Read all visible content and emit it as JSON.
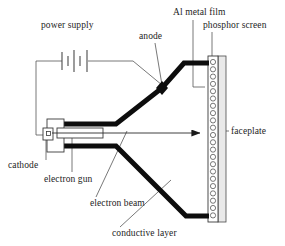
{
  "figure": {
    "background_color": "#ffffff",
    "ink_color": "#1a1a1a",
    "width": 285,
    "height": 246
  },
  "labels": {
    "power_supply": "power supply",
    "anode": "anode",
    "al_metal_film": "Al metal film",
    "phosphor_screen": "phosphor screen",
    "faceplate": "faceplate",
    "cathode": "cathode",
    "electron_gun": "electron gun",
    "electron_beam": "electron beam",
    "conductive_layer": "conductive layer"
  },
  "components": {
    "battery": {
      "name": "power-supply-battery",
      "plate_count": 5,
      "symbol": "battery-cell-stack"
    },
    "anode_marker": {
      "name": "anode-node",
      "shape": "filled-diamond"
    },
    "beam_arrow": {
      "name": "electron-beam-arrow",
      "direction": "right"
    },
    "phosphor_dots": {
      "name": "phosphor-dot-column",
      "count": 22,
      "shape": "circle"
    },
    "faceplate_band": {
      "name": "faceplate-hatched-band",
      "pattern": "stippled"
    }
  },
  "colors": {
    "envelope": "#0d0d0d",
    "leader": "#555555",
    "screen_fill": "#ffffff",
    "faceplate_fill": "#e9e9e9"
  }
}
